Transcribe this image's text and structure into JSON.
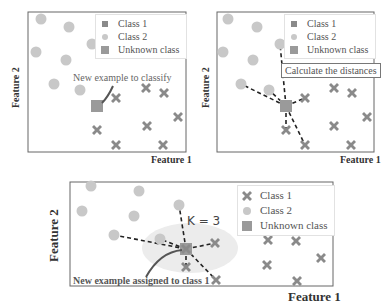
{
  "colors": {
    "class1": "#8a8a8a",
    "class2": "#c8c8c8",
    "unknown": "#9a9a9a",
    "frame": "#666666",
    "line": "#222222",
    "highlight": "#ececec",
    "arrow": "#555555"
  },
  "legend": {
    "class1": "Class 1",
    "class2": "Class 2",
    "unknown": "Unknown class"
  },
  "panels": [
    {
      "id": "panel-1",
      "xlabel": "Feature 1",
      "ylabel": "Feature 2",
      "annotation": "New example to classify"
    },
    {
      "id": "panel-2",
      "xlabel": "Feature 1",
      "ylabel": "Feature 2",
      "annotation": "Calculate the distances"
    },
    {
      "id": "panel-3",
      "xlabel": "Feature 1",
      "ylabel": "Feature 2",
      "annotation": "New example assigned to class 1",
      "k_label": "K = 3"
    }
  ]
}
